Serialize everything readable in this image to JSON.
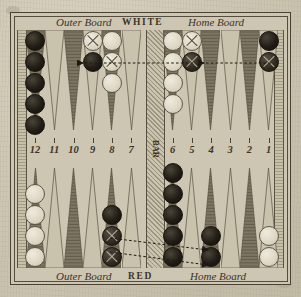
{
  "board": {
    "title_top_center": "WHITE",
    "title_bottom_center": "RED",
    "label_outer_board": "Outer Board",
    "label_home_board": "Home Board",
    "bar_label": "BAR",
    "point_numbers": [
      "12",
      "11",
      "10",
      "9",
      "8",
      "7",
      "6",
      "5",
      "4",
      "3",
      "2",
      "1"
    ],
    "colors": {
      "paper": "#cdc6b2",
      "point_dark": "#7d7663",
      "point_light": "#c9c2ac",
      "frame": "#4a4334",
      "checker_black": "#211d16",
      "checker_white": "#ddd6c4",
      "ink": "#3b3428"
    }
  },
  "top_half": {
    "quadrant_left_label": "Outer Board",
    "quadrant_right_label": "Home Board",
    "points": [
      {
        "number": "12",
        "checkers": [
          "black",
          "black",
          "black",
          "black",
          "black"
        ]
      },
      {
        "number": "11",
        "checkers": []
      },
      {
        "number": "10",
        "checkers": []
      },
      {
        "number": "9",
        "checkers": [
          "whitex",
          "black"
        ]
      },
      {
        "number": "8",
        "checkers": [
          "white",
          "whitex",
          "white"
        ]
      },
      {
        "number": "7",
        "checkers": []
      },
      {
        "number": "6",
        "checkers": [
          "white",
          "white",
          "white",
          "white"
        ]
      },
      {
        "number": "5",
        "checkers": [
          "whitex",
          "blackx"
        ]
      },
      {
        "number": "4",
        "checkers": []
      },
      {
        "number": "3",
        "checkers": []
      },
      {
        "number": "2",
        "checkers": []
      },
      {
        "number": "1",
        "checkers": [
          "black",
          "blackx"
        ]
      }
    ]
  },
  "bottom_half": {
    "quadrant_left_label": "Outer Board",
    "quadrant_right_label": "Home Board",
    "points": [
      {
        "number": "12",
        "checkers": [
          "white",
          "white",
          "white",
          "white"
        ]
      },
      {
        "number": "11",
        "checkers": []
      },
      {
        "number": "10",
        "checkers": []
      },
      {
        "number": "9",
        "checkers": []
      },
      {
        "number": "8",
        "checkers": [
          "blackx",
          "blackx",
          "black"
        ]
      },
      {
        "number": "7",
        "checkers": []
      },
      {
        "number": "6",
        "checkers": [
          "black",
          "black",
          "black",
          "black",
          "black"
        ]
      },
      {
        "number": "5",
        "checkers": []
      },
      {
        "number": "4",
        "checkers": [
          "black",
          "black"
        ]
      },
      {
        "number": "3",
        "checkers": []
      },
      {
        "number": "2",
        "checkers": []
      },
      {
        "number": "1",
        "checkers": [
          "white",
          "white"
        ]
      }
    ]
  },
  "move_arrows": [
    {
      "id": "arrow-top-1",
      "from_point": "5",
      "to_point": "9",
      "direction": "leftward",
      "style": "dashed"
    },
    {
      "id": "arrow-top-2",
      "from_point": "1",
      "to_point": "5",
      "direction": "leftward",
      "style": "dashed"
    },
    {
      "id": "arrow-bottom-1",
      "from_point": "8",
      "to_point": "4",
      "direction": "rightward",
      "style": "dashed"
    },
    {
      "id": "arrow-bottom-2",
      "from_point": "8",
      "to_point": "4",
      "direction": "rightward",
      "style": "dashed"
    }
  ]
}
